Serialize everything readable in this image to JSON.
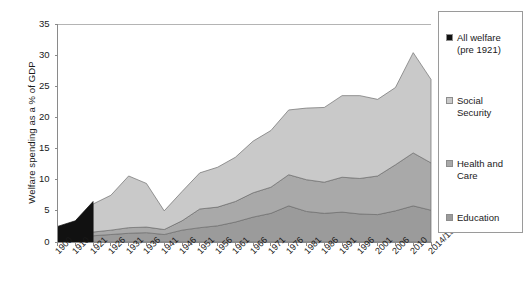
{
  "chart_data": {
    "type": "area",
    "title": "",
    "xlabel": "",
    "ylabel": "Welfare spending as a % of GDP",
    "ylim": [
      0,
      35
    ],
    "yticks": [
      0,
      5,
      10,
      15,
      20,
      25,
      30,
      35
    ],
    "grid": false,
    "legend_position": "right",
    "stacked": true,
    "categories": [
      "1900",
      "1910",
      "1921",
      "1926",
      "1931",
      "1936",
      "1941",
      "1946",
      "1951",
      "1956",
      "1961",
      "1966",
      "1971",
      "1976",
      "1981",
      "1986",
      "1991",
      "1996",
      "2001",
      "2006",
      "2010",
      "2014/15"
    ],
    "series": [
      {
        "name": "All welfare (pre 1921)",
        "color": "#111111",
        "values": [
          2.5,
          3.4,
          6.5,
          null,
          null,
          null,
          null,
          null,
          null,
          null,
          null,
          null,
          null,
          null,
          null,
          null,
          null,
          null,
          null,
          null,
          null,
          null
        ]
      },
      {
        "name": "Education",
        "color": "#9b9b9b",
        "values": [
          null,
          null,
          1.0,
          1.2,
          1.4,
          1.5,
          1.2,
          1.9,
          2.3,
          2.6,
          3.2,
          4.0,
          4.6,
          5.8,
          4.9,
          4.6,
          4.8,
          4.5,
          4.4,
          5.0,
          5.8,
          5.1
        ]
      },
      {
        "name": "Health and Care",
        "color": "#a9a9a9",
        "values": [
          null,
          null,
          0.6,
          0.7,
          0.9,
          0.9,
          0.8,
          1.5,
          3.0,
          3.0,
          3.3,
          3.9,
          4.2,
          5.0,
          5.1,
          5.0,
          5.6,
          5.7,
          6.2,
          7.4,
          8.5,
          7.6
        ]
      },
      {
        "name": "Social Security",
        "color": "#c9c9c9",
        "values": [
          null,
          null,
          4.5,
          5.6,
          8.3,
          7.0,
          3.0,
          4.7,
          5.8,
          6.4,
          7.1,
          8.3,
          9.1,
          10.4,
          11.5,
          12.0,
          13.1,
          13.3,
          12.3,
          12.4,
          16.1,
          13.4
        ]
      }
    ],
    "stack_totals": [
      2.5,
      3.4,
      12.6,
      13.2,
      14.3,
      12.5,
      5.2,
      13.2,
      17.1,
      18.7,
      20.4,
      21.8,
      22.8,
      26.2,
      25.8,
      25.8,
      26.7,
      26.1,
      25.6,
      26.2,
      30.4,
      26.1
    ]
  },
  "legend": {
    "items": [
      {
        "label": "All welfare\n(pre 1921)",
        "color": "#111111"
      },
      {
        "label": "Social\nSecurity",
        "color": "#c9c9c9"
      },
      {
        "label": "Health and\nCare",
        "color": "#a9a9a9"
      },
      {
        "label": "Education",
        "color": "#9b9b9b"
      }
    ]
  },
  "axis": {
    "y_title": "Welfare spending as a % of GDP",
    "y_labels": [
      "0",
      "5",
      "10",
      "15",
      "20",
      "25",
      "30",
      "35"
    ],
    "x_labels": [
      "1900",
      "1910",
      "1921",
      "1926",
      "1931",
      "1936",
      "1941",
      "1946",
      "1951",
      "1956",
      "1961",
      "1966",
      "1971",
      "1976",
      "1981",
      "1986",
      "1991",
      "1996",
      "2001",
      "2006",
      "2010",
      "2014/15"
    ]
  }
}
